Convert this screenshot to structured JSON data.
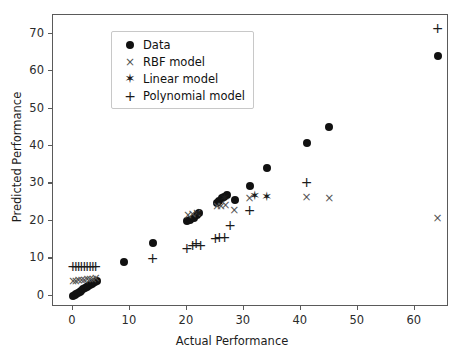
{
  "chart_data": {
    "type": "scatter",
    "title": "",
    "xlabel": "Actual Performance",
    "ylabel": "Predicted Performance",
    "xlim": [
      -3.5,
      66.0
    ],
    "ylim": [
      -3.0,
      75.0
    ],
    "xticks": [
      0,
      10,
      20,
      30,
      40,
      50,
      60
    ],
    "yticks": [
      0,
      10,
      20,
      30,
      40,
      50,
      60,
      70
    ],
    "grid": false,
    "legend_position": "upper left",
    "marker_color": "#111111",
    "series": [
      {
        "name": "Data",
        "marker": "circle",
        "points": [
          [
            0.0,
            0.0
          ],
          [
            0.3,
            0.3
          ],
          [
            0.6,
            0.5
          ],
          [
            0.9,
            0.8
          ],
          [
            1.2,
            1.1
          ],
          [
            1.5,
            1.4
          ],
          [
            1.8,
            1.7
          ],
          [
            2.1,
            2.0
          ],
          [
            2.4,
            2.3
          ],
          [
            2.7,
            2.6
          ],
          [
            3.0,
            2.9
          ],
          [
            3.3,
            3.2
          ],
          [
            3.6,
            3.5
          ],
          [
            3.9,
            3.8
          ],
          [
            4.2,
            4.0
          ],
          [
            9.0,
            9.0
          ],
          [
            14.0,
            14.0
          ],
          [
            20.0,
            20.0
          ],
          [
            20.6,
            20.3
          ],
          [
            21.2,
            20.8
          ],
          [
            21.8,
            21.6
          ],
          [
            22.2,
            22.0
          ],
          [
            25.2,
            24.8
          ],
          [
            25.7,
            25.4
          ],
          [
            26.1,
            26.0
          ],
          [
            26.5,
            26.4
          ],
          [
            27.0,
            27.0
          ],
          [
            28.4,
            25.6
          ],
          [
            31.0,
            29.3
          ],
          [
            34.0,
            34.0
          ],
          [
            41.0,
            40.7
          ],
          [
            45.0,
            45.0
          ],
          [
            64.0,
            64.0
          ]
        ]
      },
      {
        "name": "RBF model",
        "marker": "x",
        "points": [
          [
            0.0,
            3.9
          ],
          [
            0.5,
            4.0
          ],
          [
            1.0,
            4.1
          ],
          [
            1.5,
            4.2
          ],
          [
            2.0,
            4.3
          ],
          [
            2.5,
            4.4
          ],
          [
            3.0,
            4.5
          ],
          [
            3.5,
            4.6
          ],
          [
            4.0,
            4.7
          ],
          [
            20.2,
            21.6
          ],
          [
            21.0,
            21.9
          ],
          [
            21.8,
            22.2
          ],
          [
            25.3,
            23.9
          ],
          [
            26.0,
            24.1
          ],
          [
            26.8,
            24.3
          ],
          [
            28.3,
            23.0
          ],
          [
            31.0,
            26.0
          ],
          [
            41.0,
            26.4
          ],
          [
            45.0,
            26.2
          ],
          [
            64.0,
            20.8
          ]
        ]
      },
      {
        "name": "Linear model",
        "marker": "star",
        "points": [
          [
            22.0,
            22.0
          ],
          [
            26.6,
            26.3
          ],
          [
            31.9,
            26.9
          ],
          [
            34.0,
            26.6
          ]
        ]
      },
      {
        "name": "Polynomial model",
        "marker": "plus",
        "points": [
          [
            0.0,
            7.9
          ],
          [
            0.5,
            7.9
          ],
          [
            1.0,
            7.9
          ],
          [
            1.5,
            7.9
          ],
          [
            2.0,
            7.9
          ],
          [
            2.5,
            7.9
          ],
          [
            3.0,
            7.9
          ],
          [
            3.5,
            7.9
          ],
          [
            4.0,
            7.9
          ],
          [
            14.0,
            10.0
          ],
          [
            20.0,
            12.7
          ],
          [
            21.0,
            13.6
          ],
          [
            21.6,
            14.0
          ],
          [
            22.4,
            13.6
          ],
          [
            25.0,
            15.4
          ],
          [
            25.7,
            15.8
          ],
          [
            26.6,
            15.8
          ],
          [
            27.6,
            19.0
          ],
          [
            31.0,
            22.8
          ],
          [
            41.0,
            30.4
          ],
          [
            64.0,
            71.5
          ]
        ]
      }
    ]
  },
  "legend": {
    "items": [
      {
        "label": "Data",
        "marker": "circle",
        "glyph": "●"
      },
      {
        "label": "RBF model",
        "marker": "x",
        "glyph": "×"
      },
      {
        "label": "Linear model",
        "marker": "star",
        "glyph": "★"
      },
      {
        "label": "Polynomial model",
        "marker": "plus",
        "glyph": "+"
      }
    ]
  }
}
